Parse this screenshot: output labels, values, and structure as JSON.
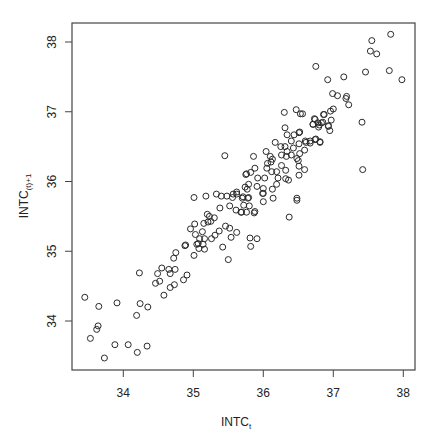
{
  "chart_data": {
    "type": "scatter",
    "title": "",
    "xlabel": "INTC",
    "xlabel_subscript": "t",
    "ylabel": "INTC",
    "ylabel_subscript": "(t)+1",
    "xlim": [
      33.3,
      38.2
    ],
    "ylim": [
      33.3,
      38.3
    ],
    "xticks": [
      34,
      35,
      36,
      37,
      38
    ],
    "yticks": [
      34,
      35,
      36,
      37,
      38
    ],
    "grid": false,
    "legend": null,
    "marker": "open-circle",
    "points": [
      [
        33.45,
        34.34
      ],
      [
        33.65,
        34.21
      ],
      [
        33.91,
        34.26
      ],
      [
        34.24,
        34.25
      ],
      [
        34.35,
        34.2
      ],
      [
        34.19,
        34.08
      ],
      [
        33.64,
        33.93
      ],
      [
        33.62,
        33.88
      ],
      [
        33.53,
        33.75
      ],
      [
        33.88,
        33.66
      ],
      [
        34.07,
        33.66
      ],
      [
        34.34,
        33.64
      ],
      [
        34.2,
        33.55
      ],
      [
        33.73,
        33.47
      ],
      [
        34.23,
        34.69
      ],
      [
        34.55,
        34.76
      ],
      [
        34.49,
        34.68
      ],
      [
        34.52,
        34.57
      ],
      [
        34.46,
        34.54
      ],
      [
        34.58,
        34.37
      ],
      [
        34.67,
        34.48
      ],
      [
        34.73,
        34.52
      ],
      [
        34.86,
        34.59
      ],
      [
        34.91,
        34.66
      ],
      [
        34.65,
        34.74
      ],
      [
        34.67,
        34.68
      ],
      [
        34.74,
        34.74
      ],
      [
        34.72,
        34.9
      ],
      [
        34.75,
        34.98
      ],
      [
        34.89,
        35.09
      ],
      [
        35.01,
        34.94
      ],
      [
        35.05,
        35.1
      ],
      [
        35.01,
        35.77
      ],
      [
        35.18,
        35.79
      ],
      [
        35.33,
        35.82
      ],
      [
        35.4,
        35.79
      ],
      [
        35.48,
        35.79
      ],
      [
        35.57,
        35.82
      ],
      [
        35.62,
        35.85
      ],
      [
        35.56,
        35.77
      ],
      [
        35.38,
        35.62
      ],
      [
        35.52,
        35.65
      ],
      [
        35.61,
        35.59
      ],
      [
        35.68,
        35.56
      ],
      [
        35.75,
        36.1
      ],
      [
        35.2,
        35.53
      ],
      [
        35.23,
        35.5
      ],
      [
        35.3,
        35.48
      ],
      [
        35.25,
        35.43
      ],
      [
        35.21,
        35.42
      ],
      [
        35.15,
        35.4
      ],
      [
        35.02,
        35.39
      ],
      [
        34.96,
        35.32
      ],
      [
        35.13,
        35.28
      ],
      [
        35.03,
        35.24
      ],
      [
        35.37,
        35.29
      ],
      [
        35.46,
        35.36
      ],
      [
        35.52,
        35.33
      ],
      [
        35.62,
        35.27
      ],
      [
        35.54,
        35.2
      ],
      [
        35.31,
        35.23
      ],
      [
        35.26,
        35.18
      ],
      [
        35.16,
        35.18
      ],
      [
        35.09,
        35.18
      ],
      [
        35.07,
        35.11
      ],
      [
        35.14,
        35.1
      ],
      [
        35.16,
        35.03
      ],
      [
        35.08,
        35.04
      ],
      [
        34.88,
        35.08
      ],
      [
        35.42,
        35.06
      ],
      [
        35.5,
        34.88
      ],
      [
        35.45,
        36.37
      ],
      [
        36.3,
        36.99
      ],
      [
        36.47,
        37.03
      ],
      [
        36.53,
        36.97
      ],
      [
        36.56,
        36.97
      ],
      [
        36.74,
        36.89
      ],
      [
        36.87,
        36.96
      ],
      [
        36.71,
        36.82
      ],
      [
        36.8,
        36.81
      ],
      [
        36.85,
        36.85
      ],
      [
        36.93,
        36.79
      ],
      [
        36.31,
        36.77
      ],
      [
        36.34,
        36.67
      ],
      [
        36.44,
        36.67
      ],
      [
        36.51,
        36.7
      ],
      [
        36.4,
        36.58
      ],
      [
        36.51,
        36.54
      ],
      [
        36.6,
        36.58
      ],
      [
        36.67,
        36.55
      ],
      [
        36.75,
        36.61
      ],
      [
        36.81,
        36.57
      ],
      [
        36.17,
        36.56
      ],
      [
        36.25,
        36.5
      ],
      [
        36.31,
        36.5
      ],
      [
        36.34,
        36.43
      ],
      [
        36.43,
        36.48
      ],
      [
        36.52,
        36.4
      ],
      [
        36.59,
        36.45
      ],
      [
        36.04,
        36.43
      ],
      [
        36.1,
        36.36
      ],
      [
        36.13,
        36.32
      ],
      [
        36.11,
        36.28
      ],
      [
        36.06,
        36.26
      ],
      [
        36.26,
        36.38
      ],
      [
        36.33,
        36.36
      ],
      [
        36.4,
        36.38
      ],
      [
        36.48,
        36.33
      ],
      [
        36.5,
        36.3
      ],
      [
        36.51,
        36.22
      ],
      [
        35.86,
        36.36
      ],
      [
        36.05,
        36.19
      ],
      [
        36.12,
        36.14
      ],
      [
        36.19,
        36.14
      ],
      [
        36.26,
        36.23
      ],
      [
        36.32,
        36.16
      ],
      [
        36.59,
        36.17
      ],
      [
        36.51,
        36.09
      ],
      [
        35.88,
        36.19
      ],
      [
        35.82,
        36.13
      ],
      [
        35.76,
        36.11
      ],
      [
        35.92,
        36.05
      ],
      [
        36.02,
        36.05
      ],
      [
        36.21,
        36.05
      ],
      [
        36.32,
        36.04
      ],
      [
        36.36,
        36.02
      ],
      [
        36.19,
        35.96
      ],
      [
        35.79,
        35.96
      ],
      [
        35.74,
        35.92
      ],
      [
        35.77,
        35.89
      ],
      [
        35.91,
        35.93
      ],
      [
        36.0,
        35.9
      ],
      [
        36.13,
        35.89
      ],
      [
        35.62,
        35.82
      ],
      [
        35.71,
        35.78
      ],
      [
        35.79,
        35.77
      ],
      [
        36.0,
        35.83
      ],
      [
        36.14,
        35.76
      ],
      [
        36.48,
        35.76
      ],
      [
        36.48,
        35.73
      ],
      [
        36.37,
        35.49
      ],
      [
        36.0,
        35.71
      ],
      [
        35.99,
        35.83
      ],
      [
        35.88,
        35.57
      ],
      [
        35.87,
        35.55
      ],
      [
        35.76,
        35.56
      ],
      [
        35.69,
        35.56
      ],
      [
        35.8,
        35.65
      ],
      [
        35.72,
        35.66
      ],
      [
        35.78,
        35.76
      ],
      [
        35.7,
        35.76
      ],
      [
        35.81,
        35.19
      ],
      [
        35.91,
        35.18
      ],
      [
        35.82,
        35.07
      ],
      [
        37.82,
        38.11
      ],
      [
        37.55,
        38.02
      ],
      [
        37.53,
        37.87
      ],
      [
        37.62,
        37.83
      ],
      [
        37.8,
        37.59
      ],
      [
        37.98,
        37.46
      ],
      [
        37.46,
        37.57
      ],
      [
        36.75,
        37.65
      ],
      [
        36.92,
        37.46
      ],
      [
        37.15,
        37.5
      ],
      [
        36.99,
        37.26
      ],
      [
        37.06,
        37.23
      ],
      [
        37.19,
        37.22
      ],
      [
        37.18,
        37.19
      ],
      [
        37.22,
        37.1
      ],
      [
        37.0,
        37.04
      ],
      [
        36.96,
        37.01
      ],
      [
        36.86,
        36.96
      ],
      [
        36.73,
        36.9
      ],
      [
        36.78,
        36.84
      ],
      [
        36.71,
        36.82
      ],
      [
        36.83,
        36.84
      ],
      [
        36.97,
        36.88
      ],
      [
        36.93,
        36.8
      ],
      [
        36.95,
        36.73
      ],
      [
        36.79,
        36.78
      ],
      [
        37.41,
        36.85
      ],
      [
        36.52,
        36.71
      ],
      [
        36.74,
        36.6
      ],
      [
        36.81,
        36.56
      ],
      [
        36.67,
        36.58
      ],
      [
        36.61,
        36.56
      ],
      [
        37.42,
        36.17
      ]
    ]
  },
  "style": {
    "marker_color": "#2a2a2a",
    "axis_color": "#444444",
    "background": "#ffffff"
  }
}
